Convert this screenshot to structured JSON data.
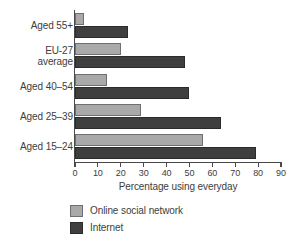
{
  "chart_data": {
    "type": "bar",
    "orientation": "horizontal",
    "title": "",
    "xlabel": "Percentage using everyday",
    "ylabel": "",
    "xlim": [
      0,
      90
    ],
    "xticks": [
      0,
      10,
      20,
      30,
      40,
      50,
      60,
      70,
      80,
      90
    ],
    "grid": false,
    "legend_position": "bottom-left",
    "categories": [
      "Aged 55+",
      "EU-27\naverage",
      "Aged 40–54",
      "Aged 25–39",
      "Aged 15–24"
    ],
    "series": [
      {
        "name": "Online social network",
        "color": "#a9a9a9",
        "values": [
          4,
          20,
          14,
          29,
          56
        ]
      },
      {
        "name": "Internet",
        "color": "#3f3f3f",
        "values": [
          23,
          48,
          50,
          64,
          79
        ]
      }
    ]
  },
  "legend": {
    "items": [
      {
        "label": "Online social network",
        "swatch": "osn"
      },
      {
        "label": "Internet",
        "swatch": "net"
      }
    ]
  }
}
